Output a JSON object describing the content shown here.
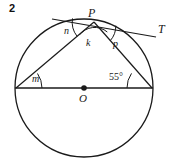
{
  "problem": {
    "number": "2"
  },
  "figure": {
    "type": "circle-geometry-diagram",
    "background_color": "#ffffff",
    "stroke_color": "#1a1a1a",
    "circle": {
      "center_label": "O",
      "center_x": 84,
      "center_y": 88,
      "radius": 69
    },
    "points": {
      "center": {
        "label": "O",
        "x": 84,
        "y": 88
      },
      "top": {
        "label": "P",
        "x": 94,
        "y": 22
      },
      "left_end": {
        "label": "",
        "x": 16,
        "y": 88
      },
      "right_end": {
        "label": "",
        "x": 152,
        "y": 88
      },
      "tangent_end": {
        "label": "T",
        "x": 156,
        "y": 36
      }
    },
    "angles": [
      {
        "label": "n",
        "vertex": "P",
        "x": 64,
        "y": 26
      },
      {
        "label": "k",
        "vertex": "P",
        "x": 86,
        "y": 38
      },
      {
        "label": "p",
        "vertex": "P",
        "x": 113,
        "y": 39
      },
      {
        "label": "m",
        "vertex": "left_end",
        "x": 32,
        "y": 74
      },
      {
        "label": "55°",
        "vertex": "right_end",
        "x": 109,
        "y": 72
      }
    ],
    "labels": {
      "P": "P",
      "T": "T",
      "O": "O",
      "n": "n",
      "k": "k",
      "p": "p",
      "m": "m",
      "angle_55": "55°"
    }
  }
}
